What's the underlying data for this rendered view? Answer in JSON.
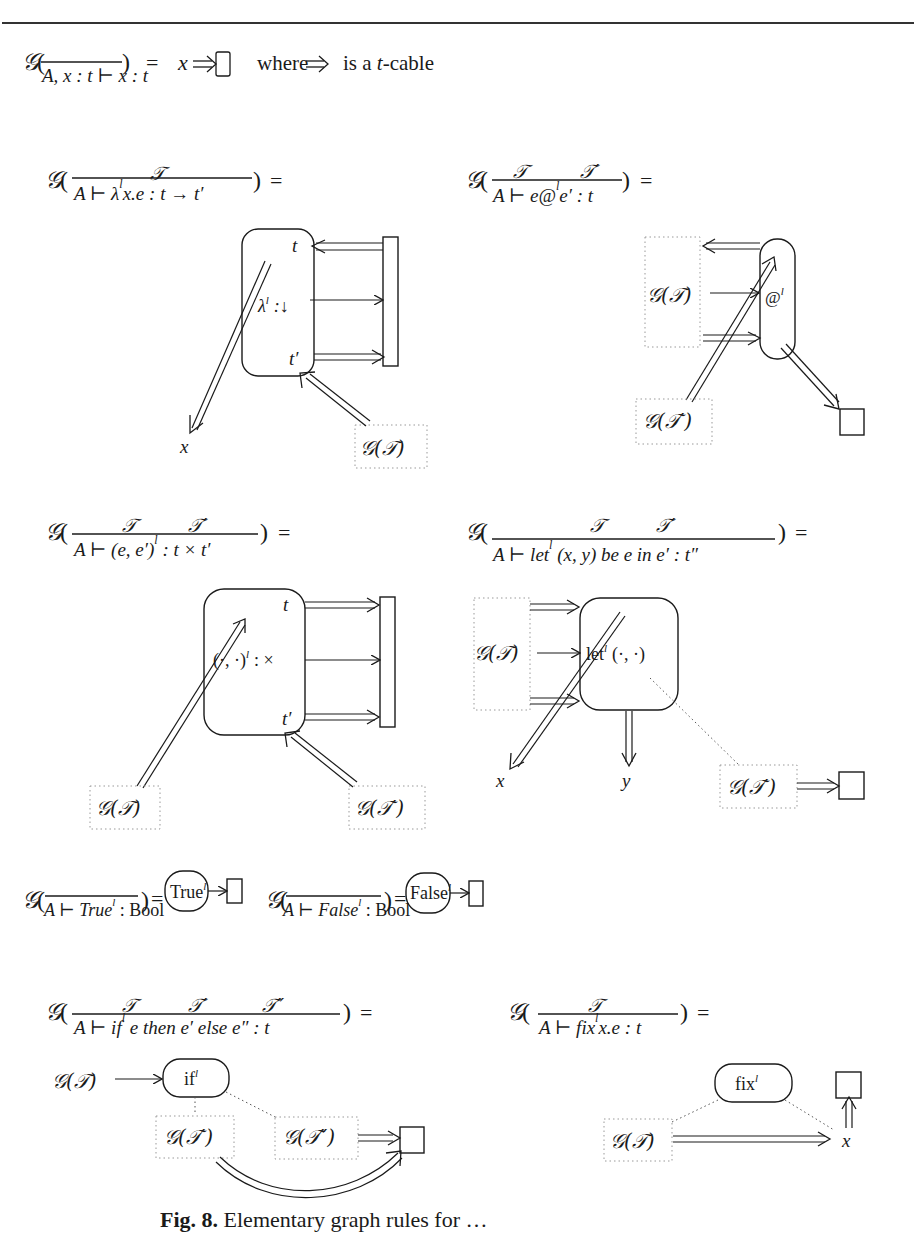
{
  "figure": {
    "caption_label": "Fig. 8.",
    "caption_text": "Elementary graph rules for …",
    "g_symbol": "𝒢",
    "T": "𝒯",
    "T1": "𝒯′",
    "T2": "𝒯″",
    "GT": "𝒢(𝒯)",
    "GT1": "𝒢(𝒯′)",
    "GT2": "𝒢(𝒯″)",
    "rule_var": {
      "conclusion": "A, x : t ⊢ x : t",
      "result_var": "x",
      "where_text": "where",
      "is_text": "is a",
      "t_text": "t",
      "cable_text": "-cable"
    },
    "rule_lambda": {
      "conclusion_a": "A ⊢ λ",
      "conclusion_b": "x.e : t → t′",
      "node_label": "λ",
      "node_type": ":↓",
      "port_t": "t",
      "port_t1": "t′",
      "out_var": "x"
    },
    "rule_app": {
      "conclusion_a": "A ⊢ e@",
      "conclusion_b": "e′ : t",
      "node_label": "@"
    },
    "rule_pair": {
      "conclusion_a": "A ⊢ (e, e′)",
      "conclusion_b": " : t × t′",
      "node_label": "(·, ·)",
      "node_type": ": ×",
      "port_t": "t",
      "port_t1": "t′"
    },
    "rule_let": {
      "conclusion_a": "A ⊢ let",
      "conclusion_b": " (x, y) be e in e′ : t″",
      "node_label": "let",
      "node_args": "(·, ·)",
      "out_x": "x",
      "out_y": "y"
    },
    "rule_true": {
      "conclusion_a": "A ⊢ True",
      "conclusion_b": " : Bool",
      "node_label": "True"
    },
    "rule_false": {
      "conclusion_a": "A ⊢ False",
      "conclusion_b": " : Bool",
      "node_label": "False"
    },
    "rule_if": {
      "conclusion_a": "A ⊢ if",
      "conclusion_b": " e then e′ else e″ : t",
      "node_label": "if"
    },
    "rule_fix": {
      "conclusion_a": "A ⊢ fix",
      "conclusion_b": "x.e : t",
      "node_label": "fix",
      "out_var": "x"
    },
    "label_sup": "l",
    "equals": "=",
    "lparen": "(",
    "rparen": ")"
  }
}
